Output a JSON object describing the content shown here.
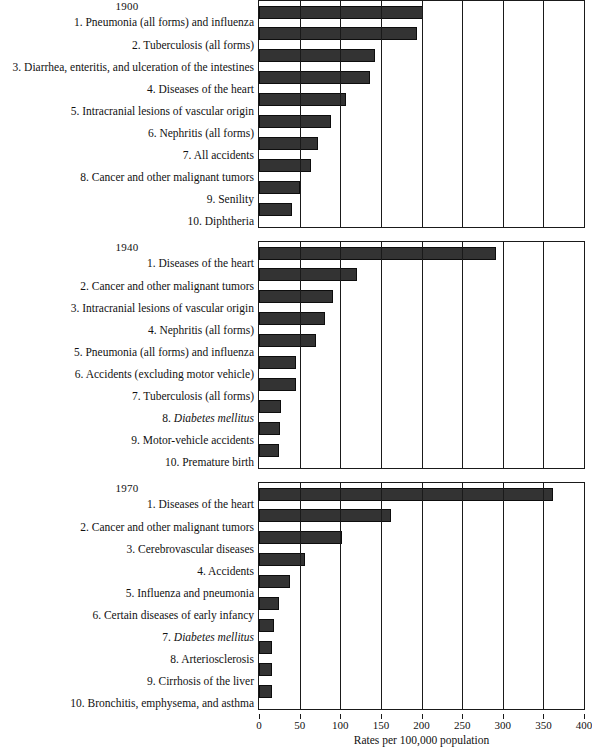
{
  "chart_data": {
    "type": "bar",
    "title": "",
    "xlabel": "Rates per 100,000 population",
    "ylabel": "",
    "xlim": [
      0,
      400
    ],
    "xticks": [
      0,
      50,
      100,
      150,
      200,
      250,
      300,
      350,
      400
    ],
    "grid": true,
    "legend": "none",
    "orientation": "horizontal",
    "bar_color": "#333333",
    "panels": [
      {
        "title": "1900",
        "categories": [
          "1. Pneumonia (all forms) and influenza",
          "2. Tuberculosis (all forms)",
          "3. Diarrhea, enteritis, and ulceration of the intestines",
          "4. Diseases of the heart",
          "5. Intracranial lesions of vascular origin",
          "6. Nephritis (all forms)",
          "7. All accidents",
          "8. Cancer and other malignant tumors",
          "9. Senility",
          "10. Diphtheria"
        ],
        "values": [
          202,
          194,
          143,
          137,
          107,
          89,
          72,
          64,
          50,
          40
        ],
        "italic_parts": []
      },
      {
        "title": "1940",
        "categories": [
          "1. Diseases of the heart",
          "2. Cancer and other malignant tumors",
          "3. Intracranial lesions of vascular origin",
          "4. Nephritis (all forms)",
          "5. Pneumonia (all forms) and influenza",
          "6. Accidents (excluding motor vehicle)",
          "7. Tuberculosis (all forms)",
          "8. Diabetes mellitus",
          "9. Motor-vehicle accidents",
          "10. Premature birth"
        ],
        "values": [
          292,
          120,
          91,
          81,
          70,
          45,
          46,
          27,
          26,
          25
        ],
        "italic_parts": [
          "Diabetes mellitus"
        ]
      },
      {
        "title": "1970",
        "categories": [
          "1. Diseases of the heart",
          "2. Cancer and other malignant tumors",
          "3. Cerebrovascular diseases",
          "4. Accidents",
          "5. Influenza and pneumonia",
          "6. Certain diseases of early infancy",
          "7. Diabetes mellitus",
          "8. Arteriosclerosis",
          "9. Cirrhosis of the liver",
          "10. Bronchitis, emphysema, and asthma"
        ],
        "values": [
          362,
          162,
          102,
          56,
          38,
          24,
          19,
          16,
          16,
          16
        ],
        "italic_parts": [
          "Diabetes mellitus"
        ]
      }
    ]
  }
}
